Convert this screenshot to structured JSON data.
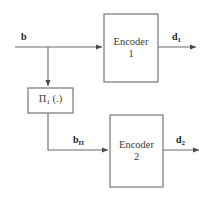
{
  "diagram": {
    "type": "block-diagram",
    "background_color": "#ffffff",
    "line_color": "#5a5a5a",
    "box_stroke_color": "#6e6e6e",
    "text_color": "#3b3b3b",
    "label_color": "#1d1d1d",
    "blocks": [
      {
        "id": "encoder-1",
        "line1": "Encoder",
        "line2": "1",
        "x": 104,
        "y": 14,
        "width": 54,
        "height": 68
      },
      {
        "id": "interleaver-1",
        "text": "Π",
        "subscript": "1",
        "suffix": " (.)",
        "x": 28,
        "y": 88,
        "width": 45,
        "height": 25
      },
      {
        "id": "encoder-2",
        "line1": "Encoder",
        "line2": "2",
        "x": 110,
        "y": 115,
        "width": 53,
        "height": 72
      }
    ],
    "signals": [
      {
        "id": "input-b",
        "symbol": "b",
        "subscript": "",
        "x": 21,
        "y": 31
      },
      {
        "id": "interleaved-b",
        "symbol": "b",
        "subscript": "Π",
        "x": 73,
        "y": 134
      },
      {
        "id": "output-d1",
        "symbol": "d",
        "subscript": "1",
        "x": 172,
        "y": 31
      },
      {
        "id": "output-d2",
        "symbol": "d",
        "subscript": "2",
        "x": 176,
        "y": 134
      }
    ],
    "connections": [
      {
        "id": "b-to-encoder-1",
        "from": "input",
        "to": "encoder-1",
        "arrow": true
      },
      {
        "id": "b-branch-to-interleaver",
        "from": "branch-node",
        "to": "interleaver-1",
        "arrow": true
      },
      {
        "id": "interleaver-to-encoder-2",
        "from": "interleaver-1",
        "to": "encoder-2",
        "arrow": true
      },
      {
        "id": "encoder-1-to-d1",
        "from": "encoder-1",
        "to": "output-d1",
        "arrow": true
      },
      {
        "id": "encoder-2-to-d2",
        "from": "encoder-2",
        "to": "output-d2",
        "arrow": true
      }
    ]
  }
}
